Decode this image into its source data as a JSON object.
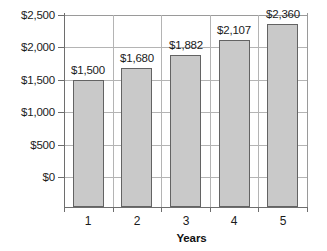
{
  "chart_data": {
    "type": "bar",
    "title": "",
    "xlabel": "Years",
    "ylabel": "",
    "categories": [
      "1",
      "2",
      "3",
      "4",
      "5"
    ],
    "values": [
      1500,
      1680,
      1882,
      2107,
      2360
    ],
    "data_labels": [
      "$1,500",
      "$1,680",
      "$1,882",
      "$2,107",
      "$2,360"
    ],
    "ylim": [
      0,
      2500
    ],
    "ytick_values": [
      0,
      500,
      1000,
      1500,
      2000,
      2500
    ],
    "ytick_labels": [
      "$0",
      "$500",
      "$1,000",
      "$1,500",
      "$2,000",
      "$2,500"
    ],
    "grid": "horizontal-and-vertical",
    "legend": "none",
    "bar_color": "#c9c9c9",
    "bar_border_color": "#636363",
    "gridline_color": "#b4b4b4",
    "axis_color": "#6e6e6e",
    "text_color": "#1b1b1b"
  }
}
